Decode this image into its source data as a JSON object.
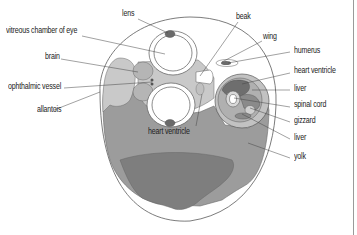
{
  "colors": {
    "outline": "#555555",
    "light_gray": "#c9c9c9",
    "mid_gray": "#9a9a9a",
    "dark_gray": "#7c7c7c",
    "organ_dark": "#6a6a6a",
    "white": "#ffffff"
  },
  "labels_left": [
    {
      "id": "vitreous",
      "text": "vitreous chamber of eye"
    },
    {
      "id": "brain",
      "text": "brain"
    },
    {
      "id": "ophthalmic",
      "text": "ophthalmic vessel"
    },
    {
      "id": "allantois",
      "text": "allantois"
    }
  ],
  "labels_top": [
    {
      "id": "lens",
      "text": "lens"
    },
    {
      "id": "beak",
      "text": "beak"
    }
  ],
  "labels_right": [
    {
      "id": "wing",
      "text": "wing"
    },
    {
      "id": "humerus",
      "text": "humerus"
    },
    {
      "id": "heart_ventricle",
      "text": "heart ventricle"
    },
    {
      "id": "liver_1",
      "text": "liver"
    },
    {
      "id": "spinal_cord",
      "text": "spinal cord"
    },
    {
      "id": "gizzard",
      "text": "gizzard"
    },
    {
      "id": "liver_2",
      "text": "liver"
    },
    {
      "id": "yolk",
      "text": "yolk"
    }
  ],
  "labels_inner": [
    {
      "id": "heart_ventricle_inner",
      "text": "heart ventricle"
    }
  ]
}
